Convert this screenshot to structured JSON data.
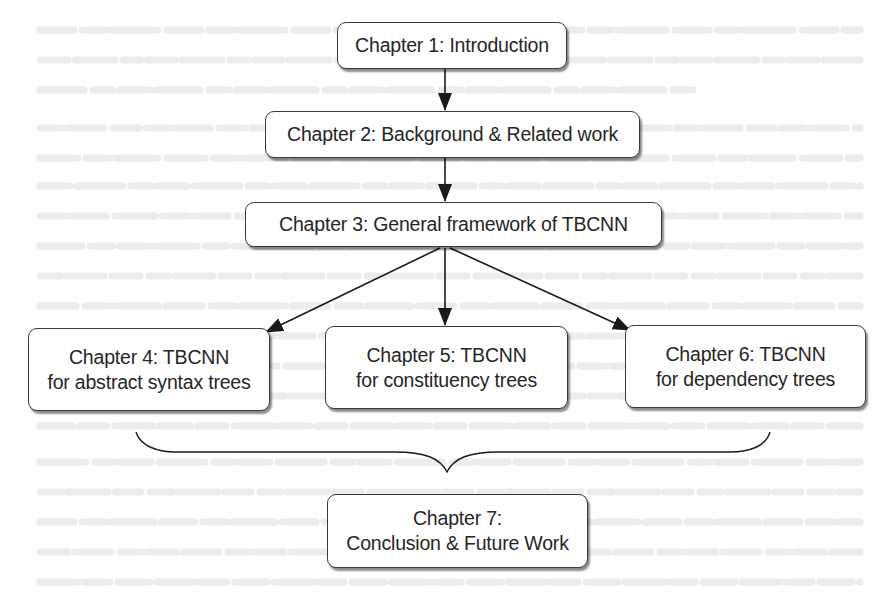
{
  "diagram": {
    "type": "thesis-chapter-flowchart",
    "nodes": [
      {
        "id": "ch1",
        "lines": [
          "Chapter 1: Introduction"
        ]
      },
      {
        "id": "ch2",
        "lines": [
          "Chapter 2: Background & Related work"
        ]
      },
      {
        "id": "ch3",
        "lines": [
          "Chapter 3: General framework of TBCNN"
        ]
      },
      {
        "id": "ch4",
        "lines": [
          "Chapter 4: TBCNN",
          "for abstract syntax trees"
        ]
      },
      {
        "id": "ch5",
        "lines": [
          "Chapter 5: TBCNN",
          "for constituency trees"
        ]
      },
      {
        "id": "ch6",
        "lines": [
          "Chapter 6: TBCNN",
          "for dependency trees"
        ]
      },
      {
        "id": "ch7",
        "lines": [
          "Chapter 7:",
          "Conclusion & Future Work"
        ]
      }
    ],
    "edges": [
      {
        "from": "ch1",
        "to": "ch2",
        "style": "arrow"
      },
      {
        "from": "ch2",
        "to": "ch3",
        "style": "arrow"
      },
      {
        "from": "ch3",
        "to": "ch4",
        "style": "arrow"
      },
      {
        "from": "ch3",
        "to": "ch5",
        "style": "arrow"
      },
      {
        "from": "ch3",
        "to": "ch6",
        "style": "arrow"
      },
      {
        "from": [
          "ch4",
          "ch5",
          "ch6"
        ],
        "to": "ch7",
        "style": "curly-brace"
      }
    ],
    "colors": {
      "box_border": "#3a3a3a",
      "box_fill": "#ffffff",
      "text": "#262626",
      "arrow": "#1a1a1a",
      "background": "#ffffff"
    }
  }
}
